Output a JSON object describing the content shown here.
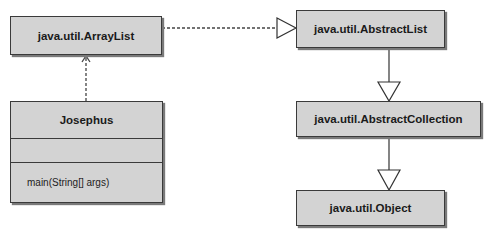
{
  "diagram": {
    "type": "UML class diagram",
    "classes": [
      {
        "id": "arraylist",
        "name": "java.util.ArrayList"
      },
      {
        "id": "josephus",
        "name": "Josephus",
        "attributes": [],
        "operations": [
          "main(String[] args)"
        ]
      },
      {
        "id": "abstractlist",
        "name": "java.util.AbstractList"
      },
      {
        "id": "abstractcollection",
        "name": "java.util.AbstractCollection"
      },
      {
        "id": "object",
        "name": "java.util.Object"
      }
    ],
    "relationships": [
      {
        "from": "josephus",
        "to": "arraylist",
        "kind": "dependency",
        "style": "dashed",
        "arrow": "open"
      },
      {
        "from": "arraylist",
        "to": "abstractlist",
        "kind": "generalization",
        "style": "dashed",
        "arrow": "hollow-triangle"
      },
      {
        "from": "abstractlist",
        "to": "abstractcollection",
        "kind": "generalization",
        "style": "solid",
        "arrow": "hollow-triangle"
      },
      {
        "from": "abstractcollection",
        "to": "object",
        "kind": "generalization",
        "style": "solid",
        "arrow": "hollow-triangle"
      }
    ],
    "colors": {
      "box_fill": "#d3d3d3",
      "border": "#3a3a3a",
      "shadow": "#7a7a7a"
    }
  }
}
